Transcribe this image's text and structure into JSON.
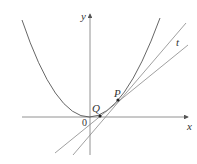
{
  "figure": {
    "labels": {
      "x_axis": "x",
      "y_axis": "y",
      "origin": "0",
      "point_p": "P",
      "point_q": "Q",
      "tangent": "t"
    },
    "colors": {
      "curve": "#555555",
      "lines": "#888888",
      "axes": "#777777",
      "points": "#222222",
      "text": "#333333"
    }
  }
}
